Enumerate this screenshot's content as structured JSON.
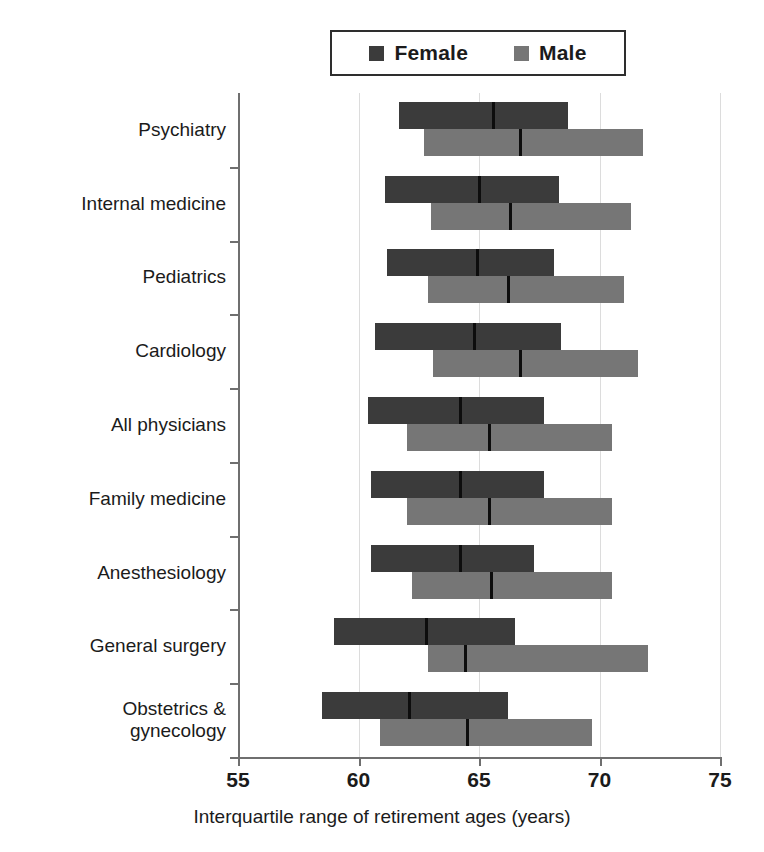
{
  "chart_data": {
    "type": "bar",
    "subtype": "interquartile-range-bars",
    "title": "",
    "xlabel": "Interquartile range of retirement ages (years)",
    "ylabel": "",
    "xlim": [
      55,
      75
    ],
    "xticks": [
      55,
      60,
      65,
      70,
      75
    ],
    "xtick_labels": [
      "55",
      "60",
      "65",
      "70",
      "75"
    ],
    "grid": "vertical",
    "legend_position": "top-center",
    "legend": [
      {
        "name": "Female",
        "color": "#3b3b3b",
        "swatch": "female-swatch"
      },
      {
        "name": "Male",
        "color": "#767676",
        "swatch": "male-swatch"
      }
    ],
    "categories": [
      "Psychiatry",
      "Internal medicine",
      "Pediatrics",
      "Cardiology",
      "All physicians",
      "Family medicine",
      "Anesthesiology",
      "General surgery",
      "Obstetrics & gynecology"
    ],
    "series": [
      {
        "name": "Female",
        "color": "#3b3b3b",
        "data": [
          {
            "category": "Psychiatry",
            "q1": 61.7,
            "median": 65.6,
            "q3": 68.7
          },
          {
            "category": "Internal medicine",
            "q1": 61.1,
            "median": 65.0,
            "q3": 68.3
          },
          {
            "category": "Pediatrics",
            "q1": 61.2,
            "median": 64.9,
            "q3": 68.1
          },
          {
            "category": "Cardiology",
            "q1": 60.7,
            "median": 64.8,
            "q3": 68.4
          },
          {
            "category": "All physicians",
            "q1": 60.4,
            "median": 64.2,
            "q3": 67.7
          },
          {
            "category": "Family medicine",
            "q1": 60.5,
            "median": 64.2,
            "q3": 67.7
          },
          {
            "category": "Anesthesiology",
            "q1": 60.5,
            "median": 64.2,
            "q3": 67.3
          },
          {
            "category": "General surgery",
            "q1": 59.0,
            "median": 62.8,
            "q3": 66.5
          },
          {
            "category": "Obstetrics & gynecology",
            "q1": 58.5,
            "median": 62.1,
            "q3": 66.2
          }
        ]
      },
      {
        "name": "Male",
        "color": "#767676",
        "data": [
          {
            "category": "Psychiatry",
            "q1": 62.7,
            "median": 66.7,
            "q3": 71.8
          },
          {
            "category": "Internal medicine",
            "q1": 63.0,
            "median": 66.3,
            "q3": 71.3
          },
          {
            "category": "Pediatrics",
            "q1": 62.9,
            "median": 66.2,
            "q3": 71.0
          },
          {
            "category": "Cardiology",
            "q1": 63.1,
            "median": 66.7,
            "q3": 71.6
          },
          {
            "category": "All physicians",
            "q1": 62.0,
            "median": 65.4,
            "q3": 70.5
          },
          {
            "category": "Family medicine",
            "q1": 62.0,
            "median": 65.4,
            "q3": 70.5
          },
          {
            "category": "Anesthesiology",
            "q1": 62.2,
            "median": 65.5,
            "q3": 70.5
          },
          {
            "category": "General surgery",
            "q1": 62.9,
            "median": 64.4,
            "q3": 72.0
          },
          {
            "category": "Obstetrics & gynecology",
            "q1": 60.9,
            "median": 64.5,
            "q3": 69.7
          }
        ]
      }
    ]
  },
  "axis": {
    "x_title": "Interquartile range of retirement ages (years)"
  }
}
